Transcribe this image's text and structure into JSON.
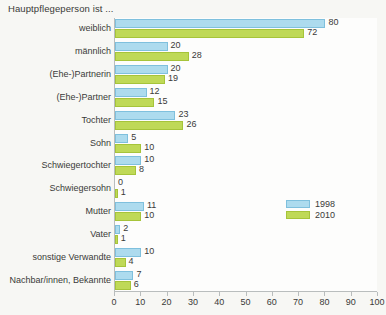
{
  "chart_data": {
    "type": "bar",
    "orientation": "horizontal",
    "title": "Hauptpflegeperson ist ...",
    "xlabel": "",
    "ylabel": "",
    "xlim": [
      0,
      100
    ],
    "xticks": [
      0,
      10,
      20,
      30,
      40,
      50,
      60,
      70,
      80,
      90,
      100
    ],
    "grid": false,
    "legend_position": "inside-right",
    "categories": [
      "weiblich",
      "männlich",
      "(Ehe-)Partnerin",
      "(Ehe-)Partner",
      "Tochter",
      "Sohn",
      "Schwiegertochter",
      "Schwiegersohn",
      "Mutter",
      "Vater",
      "sonstige Verwandte",
      "Nachbar/innen, Bekannte"
    ],
    "series": [
      {
        "name": "1998",
        "color": "#addbee",
        "values": [
          80,
          20,
          20,
          12,
          23,
          5,
          10,
          0,
          11,
          2,
          10,
          7
        ]
      },
      {
        "name": "2010",
        "color": "#bfd957",
        "values": [
          72,
          28,
          19,
          15,
          26,
          10,
          8,
          1,
          10,
          1,
          4,
          6
        ]
      }
    ]
  }
}
